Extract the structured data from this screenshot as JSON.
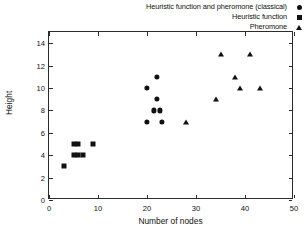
{
  "chart_data": {
    "type": "scatter",
    "title": "",
    "xlabel": "Number of nodes",
    "ylabel": "Height",
    "xlim": [
      0,
      50
    ],
    "ylim": [
      0,
      15
    ],
    "xticks": [
      0,
      10,
      20,
      30,
      40,
      50
    ],
    "yticks": [
      0,
      2,
      4,
      6,
      8,
      10,
      12,
      14
    ],
    "grid": false,
    "legend_position": "top-right-outside",
    "series": [
      {
        "name": "Heuristic function and pheromone (classical)",
        "marker": "circle",
        "color": "#111111",
        "points": [
          {
            "x": 20,
            "y": 10
          },
          {
            "x": 22,
            "y": 11
          },
          {
            "x": 22,
            "y": 9
          },
          {
            "x": 21.4,
            "y": 8
          },
          {
            "x": 22.6,
            "y": 8
          },
          {
            "x": 20,
            "y": 7
          },
          {
            "x": 23,
            "y": 7
          }
        ]
      },
      {
        "name": "Heuristic function",
        "marker": "square",
        "color": "#111111",
        "points": [
          {
            "x": 3,
            "y": 3
          },
          {
            "x": 5,
            "y": 4
          },
          {
            "x": 6,
            "y": 4
          },
          {
            "x": 7,
            "y": 4
          },
          {
            "x": 5,
            "y": 5
          },
          {
            "x": 6,
            "y": 5
          },
          {
            "x": 9,
            "y": 5
          }
        ]
      },
      {
        "name": "Pheromone",
        "marker": "triangle",
        "color": "#111111",
        "points": [
          {
            "x": 28,
            "y": 7
          },
          {
            "x": 34,
            "y": 9
          },
          {
            "x": 35,
            "y": 13
          },
          {
            "x": 38,
            "y": 11
          },
          {
            "x": 39,
            "y": 10
          },
          {
            "x": 41,
            "y": 13
          },
          {
            "x": 43,
            "y": 10
          }
        ]
      }
    ]
  },
  "legend": {
    "items": [
      {
        "label": "Heuristic function and pheromone (classical)",
        "marker": "circle"
      },
      {
        "label": "Heuristic function",
        "marker": "square"
      },
      {
        "label": "Pheromone",
        "marker": "triangle"
      }
    ]
  },
  "axes": {
    "xlabel": "Number of nodes",
    "ylabel": "Height"
  }
}
